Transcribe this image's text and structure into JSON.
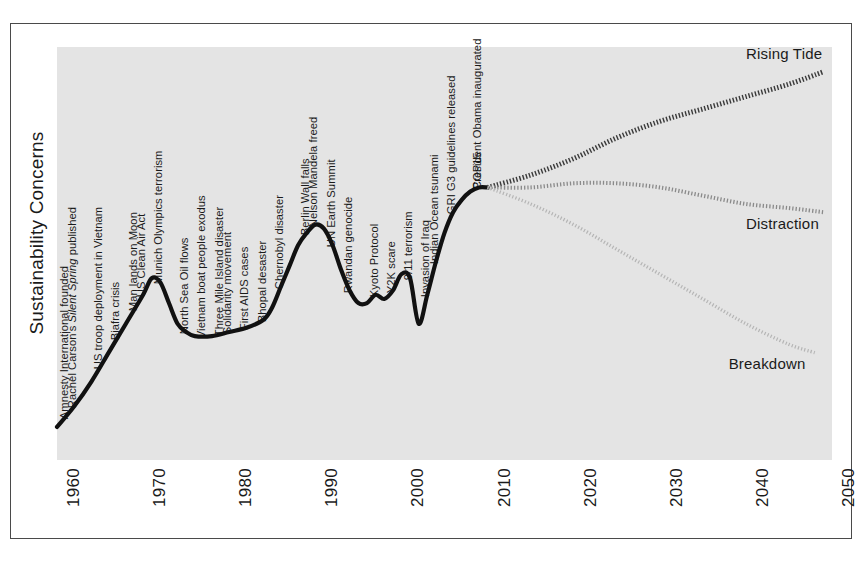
{
  "figure": {
    "y_axis_title": "Sustainability Concerns",
    "background_color": "#e4e4e4",
    "frame_color": "#4a4a4a"
  },
  "chart_data": {
    "type": "line",
    "title": "",
    "xlabel": "",
    "ylabel": "Sustainability Concerns",
    "xlim": [
      1960,
      2050
    ],
    "ylim": [
      0,
      100
    ],
    "grid": false,
    "legend_position": "inline-right",
    "x_ticks": [
      "1960",
      "1970",
      "1980",
      "1990",
      "2000",
      "2010",
      "2020",
      "2030",
      "2040",
      "2050"
    ],
    "y_ticks": [],
    "series": [
      {
        "name": "Historical",
        "style": "solid-thick-black",
        "color": "#111111",
        "x": [
          1960,
          1962,
          1964,
          1966,
          1968,
          1970,
          1971,
          1972,
          1973,
          1974,
          1975,
          1976,
          1978,
          1980,
          1982,
          1984,
          1985,
          1986,
          1987,
          1988,
          1989,
          1990,
          1991,
          1992,
          1993,
          1994,
          1995,
          1996,
          1997,
          1998,
          1999,
          2000,
          2001,
          2002,
          2003,
          2004,
          2005,
          2006,
          2007,
          2008,
          2009,
          2010
        ],
        "y": [
          8,
          13,
          19,
          26,
          33,
          40,
          44,
          43,
          38,
          33,
          31,
          30,
          30,
          31,
          32,
          34,
          37,
          42,
          47,
          52,
          55,
          57,
          56,
          52,
          46,
          41,
          38,
          38,
          40,
          39,
          41,
          45,
          44,
          33,
          40,
          48,
          55,
          60,
          63,
          65,
          66,
          66
        ]
      },
      {
        "name": "Rising Tide",
        "style": "dotted-thick-dark",
        "color": "#3a3a3a",
        "x": [
          2010,
          2015,
          2020,
          2025,
          2030,
          2035,
          2040,
          2045,
          2049
        ],
        "y": [
          66,
          69,
          73,
          78,
          82,
          85,
          88,
          91,
          94
        ]
      },
      {
        "name": "Distraction",
        "style": "dotted-medium-gray",
        "color": "#8a8a8a",
        "x": [
          2010,
          2015,
          2020,
          2025,
          2030,
          2035,
          2040,
          2045,
          2049
        ],
        "y": [
          66,
          66,
          67,
          67,
          66,
          64,
          62,
          61,
          60
        ]
      },
      {
        "name": "Breakdown",
        "style": "dotted-thin-light",
        "color": "#b5b5b5",
        "x": [
          2010,
          2015,
          2020,
          2025,
          2030,
          2035,
          2040,
          2045,
          2048
        ],
        "y": [
          66,
          62,
          57,
          51,
          45,
          39,
          33,
          28,
          26
        ]
      }
    ],
    "scenario_labels": [
      {
        "text": "Rising Tide",
        "x": 2040,
        "y": 98
      },
      {
        "text": "Distraction",
        "x": 2040,
        "y": 57
      },
      {
        "text": "Breakdown",
        "x": 2038,
        "y": 23
      }
    ],
    "annotations": [
      {
        "text": "Amnesty International founded",
        "year": 1961
      },
      {
        "text": "Rachel Carson's Silent Spring published",
        "year": 1962,
        "italic_part": "Silent Spring"
      },
      {
        "text": "US troop deployment in Vietnam",
        "year": 1965
      },
      {
        "text": "Biafra crisis",
        "year": 1967
      },
      {
        "text": "Man lands on Moon",
        "year": 1969
      },
      {
        "text": "US Clean Air Act",
        "year": 1970
      },
      {
        "text": "Munich Olympics terrorism",
        "year": 1972
      },
      {
        "text": "North Sea Oil flows",
        "year": 1975
      },
      {
        "text": "Vietnam boat people exodus",
        "year": 1977
      },
      {
        "text": "Three Mile Island disaster",
        "year": 1979
      },
      {
        "text": "Solidarity movement",
        "year": 1980
      },
      {
        "text": "First AIDS cases",
        "year": 1982
      },
      {
        "text": "Bhopal desaster",
        "year": 1984
      },
      {
        "text": "Chernobyl disaster",
        "year": 1986
      },
      {
        "text": "Berlin Wall falls",
        "year": 1989
      },
      {
        "text": "Nelson Mandela freed",
        "year": 1990
      },
      {
        "text": "UN Earth Summit",
        "year": 1992
      },
      {
        "text": "Rwandan genocide",
        "year": 1994
      },
      {
        "text": "Kyoto Protocol",
        "year": 1997
      },
      {
        "text": "Y2K scare",
        "year": 1999
      },
      {
        "text": "9/11 terrorism",
        "year": 2001
      },
      {
        "text": "Invasion of Iraq",
        "year": 2003
      },
      {
        "text": "Indian Ocean tsunami",
        "year": 2004
      },
      {
        "text": "GRI G3 guidelines released",
        "year": 2006
      },
      {
        "text": "President Obama inaugurated",
        "year": 2009
      },
      {
        "text": "COP15",
        "year": 2009
      }
    ]
  }
}
